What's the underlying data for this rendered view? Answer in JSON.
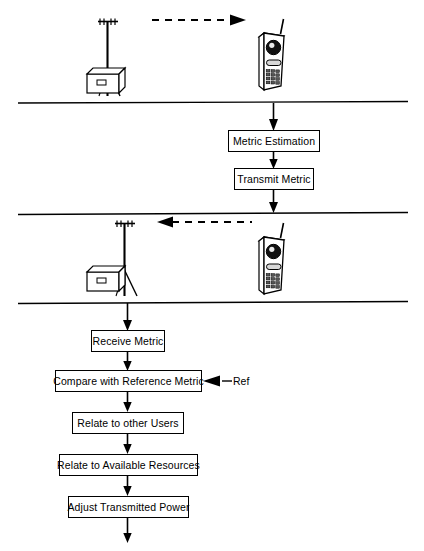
{
  "diagram": {
    "stroke_color": "#000000",
    "background_color": "#ffffff",
    "phone_body_color": "#ffffff",
    "phone_detail_color": "#000000",
    "sections": [
      {
        "name": "downlink-scene",
        "icons": [
          {
            "name": "base-station-tower-icon",
            "label": "base station tower"
          },
          {
            "name": "base-station-building-icon",
            "label": "base station equipment building"
          },
          {
            "name": "mobile-handset-icon",
            "label": "mobile handset"
          }
        ],
        "signal": {
          "name": "downlink-signal-arrow",
          "direction": "right",
          "style": "dashed"
        }
      },
      {
        "name": "mobile-processing",
        "boxes": [
          {
            "name": "metric-estimation-box",
            "label": "Metric Estimation"
          },
          {
            "name": "transmit-metric-box",
            "label": "Transmit Metric"
          }
        ]
      },
      {
        "name": "uplink-scene",
        "icons": [
          {
            "name": "base-station-tower-icon",
            "label": "base station tower"
          },
          {
            "name": "base-station-building-icon",
            "label": "base station equipment building"
          },
          {
            "name": "mobile-handset-icon",
            "label": "mobile handset"
          }
        ],
        "signal": {
          "name": "uplink-signal-arrow",
          "direction": "left",
          "style": "dashed"
        }
      },
      {
        "name": "base-station-processing",
        "boxes": [
          {
            "name": "receive-metric-box",
            "label": "Receive Metric"
          },
          {
            "name": "compare-with-reference-metric-box",
            "label": "Compare with Reference Metric"
          },
          {
            "name": "relate-to-other-users-box",
            "label": "Relate to other Users"
          },
          {
            "name": "relate-to-available-resources-box",
            "label": "Relate to Available Resources"
          },
          {
            "name": "adjust-transmitted-power-box",
            "label": "Adjust Transmitted Power"
          }
        ],
        "inputs": [
          {
            "name": "reference-input-label",
            "label": "Ref"
          }
        ]
      }
    ]
  }
}
